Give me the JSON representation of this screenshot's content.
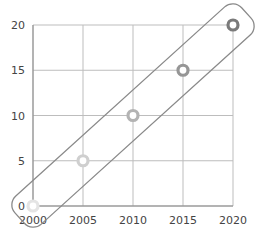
{
  "chart_data": {
    "type": "scatter",
    "title": "",
    "xlabel": "",
    "ylabel": "",
    "x": [
      2000,
      2005,
      2010,
      2015,
      2020
    ],
    "y": [
      0,
      5,
      10,
      15,
      20
    ],
    "xlim": [
      2000,
      2020
    ],
    "ylim": [
      0,
      20
    ],
    "x_ticks": [
      "2000",
      "2005",
      "2010",
      "2015",
      "2020"
    ],
    "y_ticks": [
      "0",
      "5",
      "10",
      "15",
      "20"
    ],
    "grid": true,
    "legend": null,
    "annotations": [
      "rounded capsule outline enclosing all points along the diagonal trend"
    ],
    "marker_style": "hollow ring, shade darkening from light gray (2000) to dark gray (2020)"
  },
  "colors": {
    "grid": "#bdbdbd",
    "axis": "#888888",
    "capsule": "#8a8a8a",
    "markers": [
      "#e4e4e4",
      "#cfcfcf",
      "#b3b3b3",
      "#969696",
      "#7a7a7a"
    ]
  }
}
